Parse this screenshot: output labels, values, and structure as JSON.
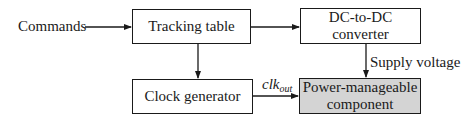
{
  "diagram": {
    "input_label": "Commands",
    "nodes": {
      "tracking_table": "Tracking table",
      "dc_converter_line1": "DC-to-DC",
      "dc_converter_line2": "converter",
      "clock_generator": "Clock generator",
      "power_component_line1": "Power-manageable",
      "power_component_line2": "component"
    },
    "edge_labels": {
      "supply_voltage": "Supply voltage",
      "clk_main": "clk",
      "clk_sub": "out"
    },
    "edges": [
      {
        "from": "Commands",
        "to": "Tracking table"
      },
      {
        "from": "Tracking table",
        "to": "DC-to-DC converter"
      },
      {
        "from": "Tracking table",
        "to": "Clock generator"
      },
      {
        "from": "DC-to-DC converter",
        "to": "Power-manageable component",
        "label": "Supply voltage"
      },
      {
        "from": "Clock generator",
        "to": "Power-manageable component",
        "label": "clk_out"
      }
    ],
    "colors": {
      "line": "#1a1a1a",
      "highlight_fill": "#d4d4d4"
    }
  }
}
